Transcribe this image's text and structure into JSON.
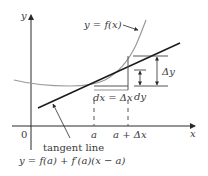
{
  "labels": {
    "y_axis": "y",
    "x_axis": "x",
    "origin": "0",
    "curve": "y = f(x)",
    "dx": "dx = Δx",
    "dy": "dy",
    "delta_y": "Δy",
    "a": "a",
    "a_plus_dx": "a + Δx",
    "tangent_caption": "tangent line",
    "tangent_equation": "y = f(a) + f′(a)(x − a)"
  },
  "colors": {
    "curve": "#9a9a9a",
    "tangent": "#1a1a1a",
    "axis": "#2a2a2a",
    "guides": "#555555",
    "text": "#3a3a3a"
  }
}
